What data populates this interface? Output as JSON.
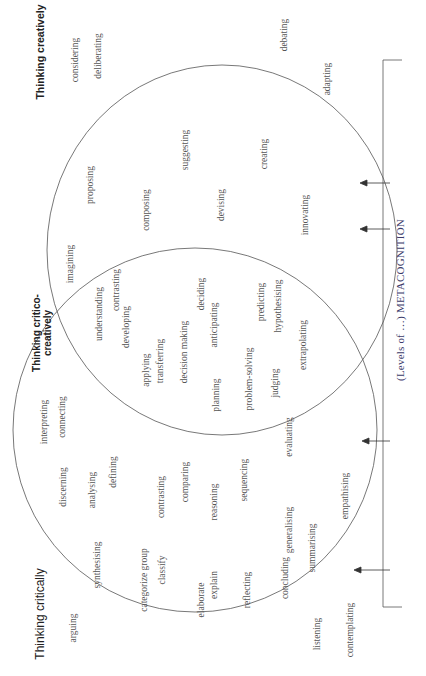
{
  "diagram": {
    "type": "venn",
    "orientation": "rotated -90deg",
    "sets": {
      "creative": {
        "label": "Thinking creatively",
        "words": [
          "considering",
          "deliberating",
          "debating",
          "adapting",
          "proposing",
          "suggesting",
          "creating",
          "imagining",
          "composing",
          "devising",
          "innovating"
        ]
      },
      "overlap": {
        "label": "Thinking critico-creatively",
        "words": [
          "understanding",
          "contrasting",
          "developing",
          "applying",
          "transferring",
          "decision making",
          "deciding",
          "anticipating",
          "planning",
          "problem-solving",
          "predicting",
          "hypothesising",
          "judging",
          "extrapolating"
        ]
      },
      "critical": {
        "label": "Thinking critically",
        "words": [
          "interpreting",
          "connecting",
          "discerning",
          "analysing",
          "defining",
          "synthesising",
          "categorize group",
          "contrasting",
          "comparing",
          "classify",
          "reasoning",
          "sequencing",
          "evaluating",
          "elaborate",
          "explain",
          "reflecting",
          "concluding",
          "generalising",
          "summarising",
          "empathising",
          "arguing",
          "listening",
          "contemplating"
        ]
      }
    },
    "axis": {
      "label": "(Levels of …) METACOGNITION",
      "arrow_count": 4
    },
    "colors": {
      "line": "#555555",
      "text": "#555555",
      "meta_text": "#3a3a6a"
    }
  }
}
